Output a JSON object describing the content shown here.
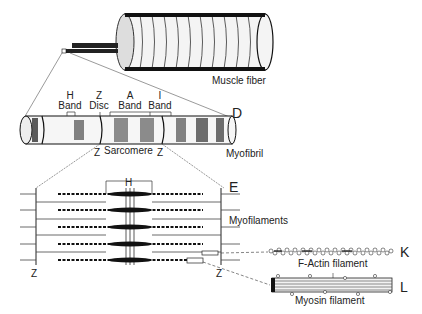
{
  "diagram": {
    "muscle_fiber": {
      "label": "Muscle fiber"
    },
    "myofibril": {
      "label": "Myofibril",
      "letter": "D",
      "bands": [
        {
          "line1": "H",
          "line2": "Band"
        },
        {
          "line1": "Z",
          "line2": "Disc"
        },
        {
          "line1": "A",
          "line2": "Band"
        },
        {
          "line1": "I",
          "line2": "Band"
        }
      ],
      "sarcomere": {
        "left": "Z",
        "label": "Sarcomere",
        "right": "Z"
      }
    },
    "sarcomere_detail": {
      "letter": "E",
      "h_label": "H",
      "myofilaments_label": "Myofilaments",
      "z_left": "Z",
      "z_right": "Z"
    },
    "actin": {
      "label": "F-Actin filament",
      "letter": "K"
    },
    "myosin": {
      "label": "Myosin filament",
      "letter": "L"
    }
  }
}
